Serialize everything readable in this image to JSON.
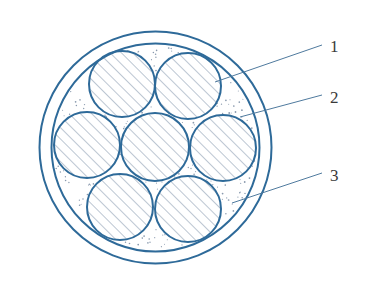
{
  "figure": {
    "type": "cable cross-section",
    "colors": {
      "background": "#ffffff",
      "stroke": "#2e6a99",
      "hatch": "#8496ad",
      "leader": "#4f7a9e",
      "filler_dots": "#8a9aae",
      "label": "#3a3a3a"
    },
    "sheath": {
      "cx": 155.5,
      "cy": 147.5,
      "outer_r": 116,
      "inner_r": 104
    },
    "conductors": [
      {
        "id": "top-left",
        "cx": 122,
        "cy": 84,
        "r": 33
      },
      {
        "id": "top-right",
        "cx": 188,
        "cy": 86,
        "r": 33
      },
      {
        "id": "left",
        "cx": 87,
        "cy": 145,
        "r": 33
      },
      {
        "id": "center",
        "cx": 155,
        "cy": 147,
        "r": 34
      },
      {
        "id": "right",
        "cx": 223,
        "cy": 148,
        "r": 33
      },
      {
        "id": "bottom-left",
        "cx": 120,
        "cy": 207,
        "r": 33
      },
      {
        "id": "bottom-right",
        "cx": 188,
        "cy": 209,
        "r": 33
      }
    ],
    "callouts": [
      {
        "label": "1",
        "text_x": 330,
        "text_y": 52,
        "line": [
          215,
          82,
          322,
          45
        ]
      },
      {
        "label": "2",
        "text_x": 330,
        "text_y": 103,
        "line": [
          240,
          117,
          322,
          95
        ]
      },
      {
        "label": "3",
        "text_x": 330,
        "text_y": 181,
        "line": [
          232,
          203,
          322,
          173
        ]
      }
    ]
  }
}
